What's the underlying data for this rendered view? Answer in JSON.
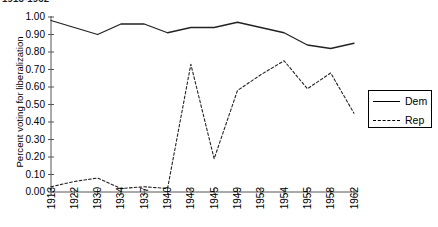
{
  "title": "1913-1962",
  "axes": {
    "y_label": "Percent voting for liberalization",
    "y_ticks": [
      "1.00",
      "0.90",
      "0.80",
      "0.70",
      "0.60",
      "0.50",
      "0.40",
      "0.30",
      "0.20",
      "0.10",
      "0.00"
    ],
    "x_ticks": [
      "1913",
      "1922",
      "1930",
      "1934",
      "1937",
      "1940",
      "1943",
      "1945",
      "1949",
      "1953",
      "1954",
      "1955",
      "1958",
      "1962"
    ]
  },
  "legend": {
    "entries": [
      {
        "label": "Dem",
        "style": "solid"
      },
      {
        "label": "Rep",
        "style": "dashed"
      }
    ]
  },
  "colors": {
    "line": "#222222",
    "axis": "#555555",
    "background": "#ffffff"
  },
  "chart_data": {
    "type": "line",
    "title": "1913-1962",
    "xlabel": "",
    "ylabel": "Percent voting for liberalization",
    "categories": [
      "1913",
      "1922",
      "1930",
      "1934",
      "1937",
      "1940",
      "1943",
      "1945",
      "1949",
      "1953",
      "1954",
      "1955",
      "1958",
      "1962"
    ],
    "ylim": [
      0.0,
      1.0
    ],
    "ytick_step": 0.1,
    "grid": false,
    "legend_position": "right",
    "series": [
      {
        "name": "Dem",
        "style": "solid",
        "values": [
          0.98,
          0.94,
          0.9,
          0.96,
          0.96,
          0.91,
          0.94,
          0.94,
          0.97,
          0.94,
          0.91,
          0.84,
          0.82,
          0.85
        ]
      },
      {
        "name": "Rep",
        "style": "dashed",
        "values": [
          0.03,
          0.06,
          0.08,
          0.02,
          0.03,
          0.02,
          0.73,
          0.19,
          0.58,
          0.67,
          0.75,
          0.59,
          0.68,
          0.45
        ]
      }
    ]
  }
}
